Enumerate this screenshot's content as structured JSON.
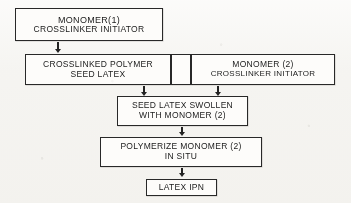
{
  "diagram": {
    "type": "flowchart",
    "colors": {
      "background": "#f3f2ef",
      "box_fill": "#fbfaf8",
      "stroke": "#242424",
      "text": "#1d1d1d"
    },
    "nodes": [
      {
        "id": "monomer-1",
        "lines": [
          "MONOMER(1)",
          "CROSSLINKER  INITIATOR"
        ]
      },
      {
        "id": "crosslinked-polymer-seed-latex",
        "lines": [
          "CROSSLINKED  POLYMER",
          "SEED  LATEX"
        ]
      },
      {
        "id": "spacer-cell",
        "lines": [
          ""
        ]
      },
      {
        "id": "monomer-2",
        "lines": [
          "MONOMER  (2)",
          "CROSSLINKER  INITIATOR"
        ]
      },
      {
        "id": "seed-latex-swollen",
        "lines": [
          "SEED  LATEX  SWOLLEN",
          "WITH  MONOMER  (2)"
        ]
      },
      {
        "id": "polymerize-monomer-2",
        "lines": [
          "POLYMERIZE  MONOMER  (2)",
          "IN  SITU"
        ]
      },
      {
        "id": "latex-ipn",
        "lines": [
          "LATEX  IPN"
        ]
      }
    ],
    "arrows": [
      {
        "id": "arrow-monomer1-to-seedlatex",
        "from": "monomer-1",
        "to": "crosslinked-polymer-seed-latex",
        "direction": "down"
      },
      {
        "id": "arrow-seedlatex-to-swollen",
        "from": "crosslinked-polymer-seed-latex",
        "to": "seed-latex-swollen",
        "direction": "down"
      },
      {
        "id": "arrow-monomer2-to-swollen",
        "from": "monomer-2",
        "to": "seed-latex-swollen",
        "direction": "down"
      },
      {
        "id": "arrow-swollen-to-polymerize",
        "from": "seed-latex-swollen",
        "to": "polymerize-monomer-2",
        "direction": "down"
      },
      {
        "id": "arrow-polymerize-to-ipn",
        "from": "polymerize-monomer-2",
        "to": "latex-ipn",
        "direction": "down"
      }
    ]
  }
}
